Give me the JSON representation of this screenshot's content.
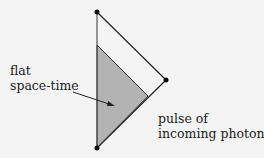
{
  "diagram": {
    "type": "penrose-diagram",
    "labels": {
      "flat_line1": "flat",
      "flat_line2": "space-time",
      "pulse_line1": "pulse of",
      "pulse_line2": "incoming photons"
    },
    "colors": {
      "background": "#f4f4f4",
      "shaded_region": "#b3b3b3",
      "lines": "#222222"
    },
    "points": {
      "top": [
        97,
        12
      ],
      "right": [
        166,
        80
      ],
      "bottom": [
        97,
        148
      ],
      "shaded_top": [
        97,
        45
      ],
      "shaded_right": [
        148,
        96
      ]
    }
  }
}
